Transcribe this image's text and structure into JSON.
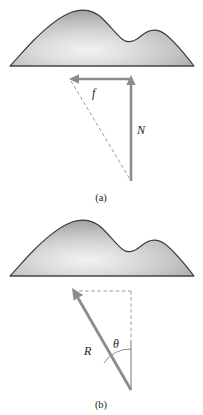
{
  "figure": {
    "background_color": "#ffffff",
    "width": 203,
    "height": 415
  },
  "colors": {
    "vector_gray": "#8c8c8c",
    "vector_gray_dark": "#7a7a7a",
    "dashed_gray": "#9a9a9a",
    "outline_dark": "#333333",
    "surface_light": "#efefef",
    "surface_mid": "#c9c9c9",
    "surface_dark": "#a8a8a8",
    "text_black": "#1a1a1a"
  },
  "panels": [
    {
      "id": "panel-a",
      "caption": "(a)",
      "surface": {
        "name": "rough-surface-mound",
        "description": "shaded hill with main peak and smaller secondary bump to the right"
      },
      "vectors": [
        {
          "name": "friction-force",
          "label": "f",
          "direction": "left",
          "style": "solid",
          "color": "#8c8c8c"
        },
        {
          "name": "normal-force",
          "label": "N",
          "direction": "up",
          "style": "solid",
          "color": "#8c8c8c"
        },
        {
          "name": "resultant-construction-line",
          "label": "",
          "direction": "diagonal",
          "style": "dashed",
          "color": "#9a9a9a"
        }
      ]
    },
    {
      "id": "panel-b",
      "caption": "(b)",
      "surface": {
        "name": "rough-surface-mound",
        "description": "shaded hill with main peak and smaller secondary bump to the right"
      },
      "vectors": [
        {
          "name": "resultant-force",
          "label": "R",
          "direction": "up-left",
          "style": "solid",
          "color": "#8c8c8c"
        },
        {
          "name": "component-guide-box",
          "label": "",
          "direction": "box",
          "style": "dashed",
          "color": "#9a9a9a"
        }
      ],
      "angle": {
        "name": "friction-angle",
        "label": "θ",
        "between": "resultant-force and vertical normal direction"
      }
    }
  ]
}
